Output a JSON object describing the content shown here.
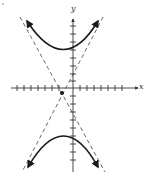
{
  "figure": {
    "type": "hyperbola-graph",
    "axes": {
      "x_label": "x",
      "y_label": "y",
      "x_ticks_left": 7,
      "x_ticks_right": 7,
      "y_ticks_up": 8,
      "y_ticks_down": 10
    },
    "center_marker": "filled-dot",
    "branches": [
      "upper branch opening up",
      "lower branch opening down"
    ],
    "asymptotes": [
      "dashed line, positive slope",
      "dashed line, negative slope"
    ],
    "colors": {
      "curve": "#1a1a1a",
      "axis": "#333333",
      "asymptote": "#555555",
      "background": "#ffffff"
    }
  }
}
